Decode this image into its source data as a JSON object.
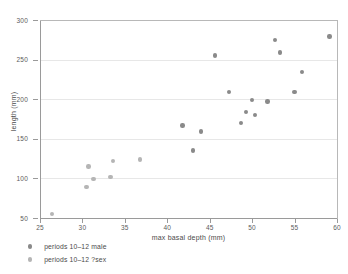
{
  "chart_data": {
    "type": "scatter",
    "title": "",
    "xlabel": "max basal depth (mm)",
    "ylabel": "length (mm)",
    "xlim": [
      25,
      60
    ],
    "ylim": [
      50,
      300
    ],
    "xticks": [
      25,
      30,
      35,
      40,
      45,
      50,
      55,
      60
    ],
    "yticks": [
      50,
      100,
      150,
      200,
      250,
      300
    ],
    "grid": "horizontal",
    "legend_position": "below-left",
    "series": [
      {
        "name": "periods 10–12 male",
        "color": "#8a8a8a",
        "points": [
          [
            41.8,
            167
          ],
          [
            43.0,
            135
          ],
          [
            44.0,
            159
          ],
          [
            45.6,
            255
          ],
          [
            47.3,
            209
          ],
          [
            48.7,
            170
          ],
          [
            49.3,
            184
          ],
          [
            50.0,
            199
          ],
          [
            50.3,
            180
          ],
          [
            51.8,
            197
          ],
          [
            52.7,
            275
          ],
          [
            53.3,
            259
          ],
          [
            55.0,
            209
          ],
          [
            55.9,
            234
          ],
          [
            59.1,
            279
          ]
        ]
      },
      {
        "name": "periods 10–12 ?sex",
        "color": "#b5b5b5",
        "points": [
          [
            26.4,
            55
          ],
          [
            30.5,
            89
          ],
          [
            30.7,
            115
          ],
          [
            31.3,
            99
          ],
          [
            33.3,
            102
          ],
          [
            33.6,
            122
          ],
          [
            36.8,
            124
          ]
        ]
      }
    ]
  },
  "legend": {
    "entries": [
      {
        "label": "periods 10–12 male",
        "color": "#8a8a8a"
      },
      {
        "label": "periods 10–12 ?sex",
        "color": "#b5b5b5"
      }
    ]
  },
  "axes": {
    "x_title": "max basal depth (mm)",
    "y_title": "length (mm)"
  },
  "colors": {
    "series_male": "#8a8a8a",
    "series_unknown_sex": "#b5b5b5",
    "gridline": "#e7e7e7",
    "axis": "#9a9a9a",
    "text": "#4a4a4a",
    "background": "#ffffff"
  }
}
